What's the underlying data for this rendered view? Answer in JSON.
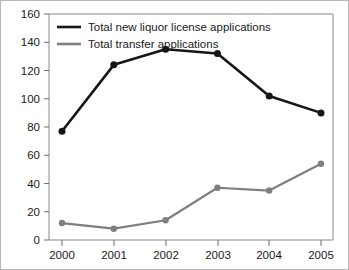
{
  "chart_data": {
    "type": "line",
    "title": "",
    "subtitle": "",
    "xlabel": "",
    "ylabel": "",
    "categories": [
      "2000",
      "2001",
      "2002",
      "2003",
      "2004",
      "2005"
    ],
    "x": [
      2000,
      2001,
      2002,
      2003,
      2004,
      2005
    ],
    "series": [
      {
        "name": "Total new liquor license applications",
        "color": "#161616",
        "values": [
          77,
          124,
          135,
          132,
          102,
          90
        ]
      },
      {
        "name": "Total transfer applications",
        "color": "#7f7f7f",
        "values": [
          12,
          8,
          14,
          37,
          35,
          54
        ]
      }
    ],
    "ylim": [
      0,
      160
    ],
    "ytick_step": 20,
    "yticks": [
      "0",
      "20",
      "40",
      "60",
      "80",
      "100",
      "120",
      "140",
      "160"
    ],
    "xticks": [
      "2000",
      "2001",
      "2002",
      "2003",
      "2004",
      "2005"
    ],
    "grid": false,
    "legend_position": "top-left",
    "markers": "circle"
  },
  "legend": {
    "items": [
      {
        "label": "Total new liquor license applications",
        "color": "#161616"
      },
      {
        "label": "Total transfer applications",
        "color": "#7f7f7f"
      }
    ]
  },
  "axes": {
    "y_tick_labels": [
      "160",
      "140",
      "120",
      "100",
      "80",
      "60",
      "40",
      "20",
      "0"
    ],
    "x_tick_labels": [
      "2000",
      "2001",
      "2002",
      "2003",
      "2004",
      "2005"
    ]
  },
  "colors": {
    "series_1": "#161616",
    "series_2": "#7f7f7f",
    "axis": "#8a8a8a",
    "text": "#1a1a1a",
    "background": "#ffffff",
    "border": "#b9b9b9"
  }
}
